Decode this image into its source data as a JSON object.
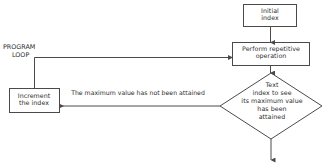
{
  "diagram": {
    "background_color": "#ffffff",
    "stroke_color": "#4a4a4a",
    "text_color": "#2e2e2e",
    "annotation": {
      "line1": "PROGRAM",
      "line2": "LOOP"
    },
    "nodes": {
      "initial_index": {
        "shape": "rectangle",
        "label": "Initial\nindex"
      },
      "perform_operation": {
        "shape": "rectangle",
        "label": "Perform repetitive\noperation"
      },
      "decision": {
        "shape": "diamond",
        "label": "Text\nindex to see\nits maximum value\nhas been\nattained"
      },
      "increment_index": {
        "shape": "rectangle",
        "label": "Increment\nthe index"
      }
    },
    "edges": {
      "no_branch_label": "The maximum value has not been attained"
    }
  }
}
